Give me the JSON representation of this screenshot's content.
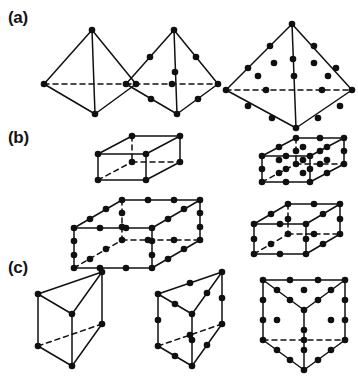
{
  "figure": {
    "background_color": "#ffffff",
    "line_color": "#111111",
    "node_color": "#101010",
    "width": 358,
    "height": 388
  },
  "rows": [
    {
      "id": "a",
      "label": "(a)",
      "family": "tetrahedron"
    },
    {
      "id": "b",
      "label": "(b)",
      "family": "hexahedron"
    },
    {
      "id": "c",
      "label": "(c)",
      "family": "prism"
    }
  ],
  "elements": {
    "tet4": {
      "name": "linear-tetrahedron",
      "node_count": 4,
      "edge_nodes": 0
    },
    "tet10": {
      "name": "quadratic-tetrahedron",
      "node_count": 10,
      "edge_nodes": 1
    },
    "tet20": {
      "name": "cubic-tetrahedron",
      "node_count": 20,
      "edge_nodes": 2
    },
    "hex8": {
      "name": "linear-hexahedron",
      "node_count": 8,
      "edge_nodes": 0
    },
    "hex27": {
      "name": "triquadratic-hexahedron",
      "node_count": 27,
      "edge_nodes": 1
    },
    "hex32": {
      "name": "cubic-hexahedron",
      "node_count": 32,
      "edge_nodes": 2
    },
    "hex20": {
      "name": "serendipity-hexahedron",
      "node_count": 20,
      "edge_nodes": 1
    },
    "wdg6": {
      "name": "linear-prism",
      "node_count": 6,
      "edge_nodes": 0
    },
    "wdg15": {
      "name": "quadratic-prism",
      "node_count": 15,
      "edge_nodes": 1
    },
    "wdg26": {
      "name": "cubic-prism",
      "node_count": 26,
      "edge_nodes": 2
    }
  },
  "geometry": {
    "tet4": {
      "verts": {
        "apex": [
          54,
          12
        ],
        "left": [
          6,
          66
        ],
        "right": [
          98,
          66
        ],
        "front": [
          57,
          96
        ]
      },
      "solid_edges": [
        [
          54,
          12,
          6,
          66
        ],
        [
          54,
          12,
          98,
          66
        ],
        [
          54,
          12,
          57,
          96
        ],
        [
          6,
          66,
          57,
          96
        ],
        [
          98,
          66,
          57,
          96
        ]
      ],
      "hidden_edges": [
        [
          6,
          66,
          98,
          66
        ]
      ],
      "nodes": [
        [
          54,
          12
        ],
        [
          6,
          66
        ],
        [
          98,
          66
        ],
        [
          57,
          96
        ]
      ]
    },
    "tet10": {
      "solid_edges": [
        [
          54,
          12,
          6,
          66
        ],
        [
          54,
          12,
          98,
          66
        ],
        [
          54,
          12,
          57,
          96
        ],
        [
          6,
          66,
          57,
          96
        ],
        [
          98,
          66,
          57,
          96
        ]
      ],
      "hidden_edges": [
        [
          6,
          66,
          98,
          66
        ]
      ],
      "nodes": [
        [
          54,
          12
        ],
        [
          6,
          66
        ],
        [
          98,
          66
        ],
        [
          57,
          96
        ],
        [
          30,
          39
        ],
        [
          76,
          39
        ],
        [
          55,
          54
        ],
        [
          31,
          81
        ],
        [
          78,
          81
        ],
        [
          52,
          66
        ]
      ]
    },
    "tet20": {
      "solid_edges": [
        [
          70,
          10,
          4,
          76
        ],
        [
          70,
          10,
          130,
          76
        ],
        [
          70,
          10,
          74,
          114
        ],
        [
          4,
          76,
          74,
          114
        ],
        [
          130,
          76,
          74,
          114
        ]
      ],
      "hidden_edges": [
        [
          4,
          76,
          130,
          76
        ]
      ],
      "nodes": [
        [
          70,
          10
        ],
        [
          4,
          76
        ],
        [
          130,
          76
        ],
        [
          74,
          114
        ],
        [
          48,
          32
        ],
        [
          26,
          54
        ],
        [
          92,
          32
        ],
        [
          114,
          54
        ],
        [
          71,
          45
        ],
        [
          72,
          62
        ],
        [
          26,
          92
        ],
        [
          50,
          104
        ],
        [
          96,
          104
        ],
        [
          118,
          92
        ],
        [
          44,
          76
        ],
        [
          100,
          76
        ],
        [
          52,
          49
        ],
        [
          92,
          49
        ],
        [
          36,
          62
        ],
        [
          106,
          62
        ]
      ]
    },
    "hex8": {
      "solid_edges": [
        [
          18,
          22,
          52,
          4
        ],
        [
          52,
          4,
          100,
          4
        ],
        [
          100,
          4,
          66,
          22
        ],
        [
          18,
          22,
          66,
          22
        ],
        [
          18,
          22,
          18,
          48
        ],
        [
          66,
          22,
          66,
          48
        ],
        [
          100,
          4,
          100,
          30
        ],
        [
          18,
          48,
          66,
          48
        ],
        [
          66,
          48,
          100,
          30
        ]
      ],
      "hidden_edges": [
        [
          18,
          48,
          52,
          30
        ],
        [
          52,
          30,
          100,
          30
        ],
        [
          52,
          4,
          52,
          30
        ]
      ],
      "nodes": [
        [
          18,
          22
        ],
        [
          52,
          4
        ],
        [
          100,
          4
        ],
        [
          66,
          22
        ],
        [
          18,
          48
        ],
        [
          52,
          30
        ],
        [
          100,
          30
        ],
        [
          66,
          48
        ]
      ]
    },
    "hex27": {
      "solid_edges": [
        [
          16,
          24,
          50,
          6
        ],
        [
          50,
          6,
          98,
          6
        ],
        [
          98,
          6,
          64,
          24
        ],
        [
          16,
          24,
          64,
          24
        ],
        [
          16,
          24,
          16,
          50
        ],
        [
          64,
          24,
          64,
          50
        ],
        [
          98,
          6,
          98,
          32
        ],
        [
          16,
          50,
          64,
          50
        ],
        [
          64,
          50,
          98,
          32
        ]
      ],
      "hidden_edges": [
        [
          16,
          50,
          50,
          32
        ],
        [
          50,
          32,
          98,
          32
        ],
        [
          50,
          6,
          50,
          32
        ]
      ],
      "nodes": [
        [
          16,
          24
        ],
        [
          50,
          6
        ],
        [
          98,
          6
        ],
        [
          64,
          24
        ],
        [
          16,
          50
        ],
        [
          50,
          32
        ],
        [
          98,
          32
        ],
        [
          64,
          50
        ],
        [
          33,
          15
        ],
        [
          74,
          6
        ],
        [
          81,
          15
        ],
        [
          40,
          24
        ],
        [
          16,
          37
        ],
        [
          50,
          19
        ],
        [
          98,
          19
        ],
        [
          64,
          37
        ],
        [
          33,
          41
        ],
        [
          74,
          32
        ],
        [
          81,
          41
        ],
        [
          40,
          50
        ],
        [
          57,
          15
        ],
        [
          40,
          37
        ],
        [
          81,
          28
        ],
        [
          57,
          41
        ],
        [
          33,
          28
        ],
        [
          74,
          19
        ],
        [
          57,
          28
        ]
      ]
    },
    "hex32": {
      "solid_edges": [
        [
          14,
          36,
          62,
          8
        ],
        [
          62,
          8,
          140,
          8
        ],
        [
          140,
          8,
          92,
          36
        ],
        [
          14,
          36,
          92,
          36
        ],
        [
          14,
          36,
          14,
          76
        ],
        [
          92,
          36,
          92,
          76
        ],
        [
          140,
          8,
          140,
          48
        ],
        [
          14,
          76,
          92,
          76
        ],
        [
          92,
          76,
          140,
          48
        ]
      ],
      "hidden_edges": [
        [
          14,
          76,
          62,
          48
        ],
        [
          62,
          48,
          140,
          48
        ],
        [
          62,
          8,
          62,
          48
        ]
      ],
      "nodes": [
        [
          14,
          36
        ],
        [
          62,
          8
        ],
        [
          140,
          8
        ],
        [
          92,
          36
        ],
        [
          14,
          76
        ],
        [
          62,
          48
        ],
        [
          140,
          48
        ],
        [
          92,
          76
        ],
        [
          30,
          27
        ],
        [
          46,
          17
        ],
        [
          88,
          8
        ],
        [
          114,
          8
        ],
        [
          124,
          17
        ],
        [
          108,
          27
        ],
        [
          40,
          36
        ],
        [
          66,
          36
        ],
        [
          14,
          49
        ],
        [
          14,
          63
        ],
        [
          62,
          21
        ],
        [
          62,
          35
        ],
        [
          140,
          21
        ],
        [
          140,
          35
        ],
        [
          92,
          49
        ],
        [
          92,
          63
        ],
        [
          30,
          67
        ],
        [
          46,
          57
        ],
        [
          88,
          48
        ],
        [
          114,
          48
        ],
        [
          124,
          57
        ],
        [
          108,
          67
        ],
        [
          40,
          76
        ],
        [
          66,
          76
        ]
      ]
    },
    "hex20": {
      "solid_edges": [
        [
          14,
          28,
          48,
          8
        ],
        [
          48,
          8,
          100,
          8
        ],
        [
          100,
          8,
          66,
          28
        ],
        [
          14,
          28,
          66,
          28
        ],
        [
          14,
          28,
          14,
          58
        ],
        [
          66,
          28,
          66,
          58
        ],
        [
          100,
          8,
          100,
          38
        ],
        [
          14,
          58,
          66,
          58
        ],
        [
          66,
          58,
          100,
          38
        ]
      ],
      "hidden_edges": [
        [
          14,
          58,
          48,
          38
        ],
        [
          48,
          38,
          100,
          38
        ],
        [
          48,
          8,
          48,
          38
        ]
      ],
      "nodes": [
        [
          14,
          28
        ],
        [
          48,
          8
        ],
        [
          100,
          8
        ],
        [
          66,
          28
        ],
        [
          14,
          58
        ],
        [
          48,
          38
        ],
        [
          100,
          38
        ],
        [
          66,
          58
        ],
        [
          31,
          18
        ],
        [
          74,
          8
        ],
        [
          83,
          18
        ],
        [
          40,
          28
        ],
        [
          14,
          43
        ],
        [
          48,
          23
        ],
        [
          100,
          23
        ],
        [
          66,
          43
        ],
        [
          31,
          48
        ],
        [
          74,
          38
        ],
        [
          83,
          48
        ],
        [
          40,
          58
        ]
      ]
    },
    "wdg6": {
      "solid_edges": [
        [
          8,
          32,
          72,
          10
        ],
        [
          8,
          32,
          42,
          52
        ],
        [
          42,
          52,
          72,
          10
        ],
        [
          8,
          32,
          8,
          84
        ],
        [
          42,
          52,
          42,
          104
        ],
        [
          72,
          10,
          72,
          62
        ],
        [
          8,
          84,
          42,
          104
        ],
        [
          42,
          104,
          72,
          62
        ]
      ],
      "hidden_edges": [
        [
          8,
          84,
          72,
          62
        ]
      ],
      "nodes": [
        [
          8,
          32
        ],
        [
          72,
          10
        ],
        [
          42,
          52
        ],
        [
          8,
          84
        ],
        [
          72,
          62
        ],
        [
          42,
          104
        ]
      ]
    },
    "wdg15": {
      "solid_edges": [
        [
          8,
          32,
          72,
          10
        ],
        [
          8,
          32,
          42,
          52
        ],
        [
          42,
          52,
          72,
          10
        ],
        [
          8,
          32,
          8,
          84
        ],
        [
          42,
          52,
          42,
          104
        ],
        [
          72,
          10,
          72,
          62
        ],
        [
          8,
          84,
          42,
          104
        ],
        [
          42,
          104,
          72,
          62
        ]
      ],
      "hidden_edges": [
        [
          8,
          84,
          72,
          62
        ]
      ],
      "nodes": [
        [
          8,
          32
        ],
        [
          72,
          10
        ],
        [
          42,
          52
        ],
        [
          8,
          84
        ],
        [
          72,
          62
        ],
        [
          42,
          104
        ],
        [
          40,
          21
        ],
        [
          25,
          42
        ],
        [
          57,
          31
        ],
        [
          8,
          58
        ],
        [
          72,
          36
        ],
        [
          42,
          78
        ],
        [
          25,
          94
        ],
        [
          57,
          83
        ],
        [
          40,
          73
        ]
      ]
    },
    "wdg26": {
      "solid_edges": [
        [
          8,
          18,
          90,
          18
        ],
        [
          8,
          18,
          49,
          48
        ],
        [
          49,
          48,
          90,
          18
        ],
        [
          8,
          18,
          8,
          78
        ],
        [
          49,
          48,
          49,
          108
        ],
        [
          90,
          18,
          90,
          78
        ],
        [
          8,
          78,
          49,
          108
        ],
        [
          49,
          108,
          90,
          78
        ]
      ],
      "hidden_edges": [
        [
          8,
          78,
          90,
          78
        ]
      ],
      "nodes": [
        [
          8,
          18
        ],
        [
          90,
          18
        ],
        [
          49,
          48
        ],
        [
          8,
          78
        ],
        [
          90,
          78
        ],
        [
          49,
          108
        ],
        [
          35,
          18
        ],
        [
          63,
          18
        ],
        [
          22,
          28
        ],
        [
          35,
          38
        ],
        [
          63,
          38
        ],
        [
          76,
          28
        ],
        [
          8,
          38
        ],
        [
          8,
          58
        ],
        [
          90,
          38
        ],
        [
          90,
          58
        ],
        [
          49,
          68
        ],
        [
          49,
          88
        ],
        [
          22,
          88
        ],
        [
          35,
          98
        ],
        [
          63,
          98
        ],
        [
          76,
          88
        ],
        [
          49,
          28
        ],
        [
          22,
          58
        ],
        [
          76,
          58
        ],
        [
          49,
          78
        ]
      ]
    }
  },
  "positions": {
    "tet4": {
      "left": 38,
      "top": 18
    },
    "tet10": {
      "left": 120,
      "top": 18
    },
    "tet20": {
      "left": 222,
      "top": 14
    },
    "hex8": {
      "left": 80,
      "top": 132
    },
    "hex27": {
      "left": 246,
      "top": 132
    },
    "hex32": {
      "left": 60,
      "top": 192
    },
    "hex20": {
      "left": 240,
      "top": 196
    },
    "wdg6": {
      "left": 30,
      "top": 262
    },
    "wdg15": {
      "left": 150,
      "top": 262
    },
    "wdg26": {
      "left": 255,
      "top": 262
    }
  },
  "node_radius": 3.3
}
